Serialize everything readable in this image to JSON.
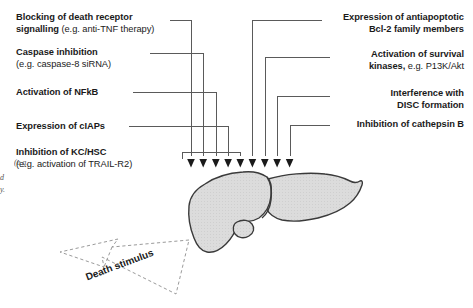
{
  "figure": {
    "organ_name": "liver",
    "stimulus_label": "Death stimulus",
    "arrow_count": 9,
    "colors": {
      "background": "#ffffff",
      "organ_fill": "#d9d9d9",
      "organ_stroke": "#3a3a3a",
      "connector": "#4d4d4d",
      "arrow": "#1a1a1a",
      "text": "#1a1a1a",
      "dashed": "#8a8a8a"
    }
  },
  "left_labels": [
    {
      "id": "blocking-death-receptor",
      "bold": "Blocking of death receptor signalling",
      "bold_line1": "Blocking of death receptor",
      "bold_line2": "signalling",
      "regular": "(e.g. anti-TNF therapy)"
    },
    {
      "id": "caspase-inhibition",
      "bold": "Caspase inhibition",
      "regular": "(e.g. caspase-8 siRNA)"
    },
    {
      "id": "activation-nfkb",
      "bold": "Activation of NFkB",
      "regular": ""
    },
    {
      "id": "expression-ciaps",
      "bold": "Expression of cIAPs",
      "regular": ""
    },
    {
      "id": "inhibition-kc-hsc",
      "bold": "Inhibition of KC/HSC",
      "regular": "(e.g. activation of TRAIL-R2)"
    }
  ],
  "right_labels": [
    {
      "id": "expression-antiapoptotic-bcl2",
      "bold_line1": "Expression of antiapoptotic",
      "bold_line2": "Bcl-2 family members",
      "regular": ""
    },
    {
      "id": "activation-survival-kinases",
      "bold_line1": "Activation of survival",
      "bold_line2": "kinases,",
      "regular": " e.g. P13K/Akt"
    },
    {
      "id": "interference-disc-formation",
      "bold_line1": "Interference with",
      "bold_line2": "DISC formation",
      "regular": ""
    },
    {
      "id": "inhibition-cathepsin-b",
      "bold_line1": "Inhibition of cathepsin B",
      "bold_line2": "",
      "regular": ""
    }
  ],
  "gutter_fragments": [
    {
      "id": "gutter-eg",
      "text": "(e.g."
    },
    {
      "id": "gutter-d",
      "text": "d"
    },
    {
      "id": "gutter-y",
      "text": "y."
    }
  ]
}
